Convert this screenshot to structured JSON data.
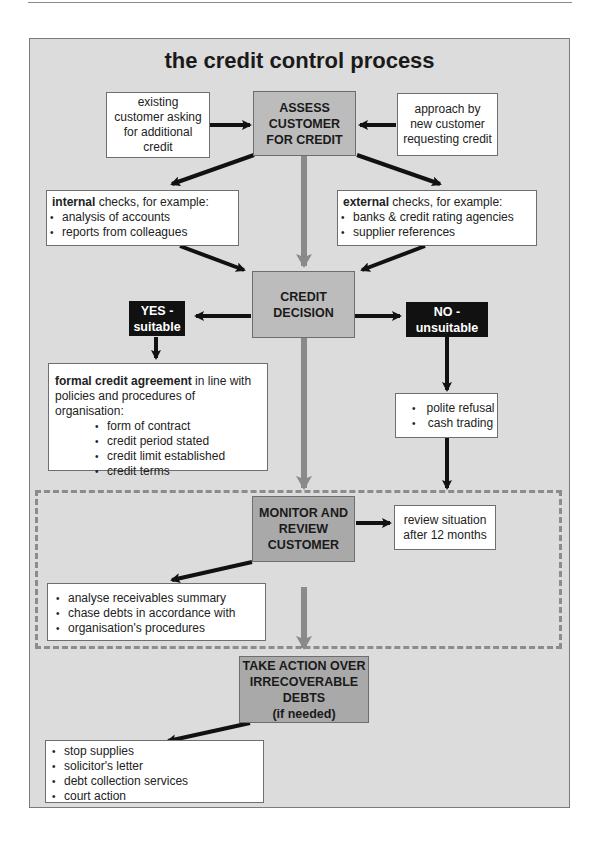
{
  "diagram": {
    "title": "the credit control process",
    "nodes": {
      "assess": {
        "lines": [
          "ASSESS",
          "CUSTOMER",
          "FOR CREDIT"
        ]
      },
      "existing_customer": {
        "lines": [
          "existing",
          "customer asking",
          "for additional",
          "credit"
        ]
      },
      "new_customer": {
        "lines": [
          "approach by",
          "new customer",
          "requesting credit"
        ]
      },
      "internal_checks": {
        "heading_bold": "internal",
        "heading_rest": " checks, for example:",
        "items": [
          "analysis of accounts",
          "reports from colleagues"
        ]
      },
      "external_checks": {
        "heading_bold": "external",
        "heading_rest": " checks, for example:",
        "items": [
          "banks & credit rating agencies",
          "supplier references"
        ]
      },
      "credit_decision": {
        "lines": [
          "CREDIT",
          "DECISION"
        ]
      },
      "yes": {
        "lines": [
          "YES -",
          "suitable"
        ]
      },
      "no": {
        "lines": [
          "NO -",
          "unsuitable"
        ]
      },
      "formal_agreement": {
        "heading_bold": "formal credit agreement",
        "heading_rest": " in line with",
        "line2": "policies and procedures of organisation:",
        "items": [
          "form of contract",
          "credit period stated",
          "credit limit established",
          "credit terms"
        ]
      },
      "unsuitable_actions": {
        "items": [
          "polite refusal",
          "cash trading"
        ]
      },
      "monitor": {
        "lines": [
          "MONITOR AND",
          "REVIEW",
          "CUSTOMER"
        ]
      },
      "review_situation": {
        "lines": [
          "review situation",
          "after 12 months"
        ]
      },
      "monitor_actions": {
        "items": [
          "analyse receivables summary",
          "chase debts in accordance with",
          "organisation's procedures"
        ]
      },
      "take_action": {
        "lines": [
          "TAKE ACTION OVER",
          "IRRECOVERABLE",
          "DEBTS",
          "(if needed)"
        ]
      },
      "debt_actions": {
        "items": [
          "stop supplies",
          "solicitor's letter",
          "debt collection services",
          "court action"
        ]
      }
    },
    "colors": {
      "panel_bg": "#dcdcdc",
      "primary_box": "#bcbcbc",
      "secondary_box": "#a9a9a9",
      "decision_label_bg": "#111111",
      "main_flow_arrow": "#8a8a8a",
      "branch_arrow": "#111111",
      "dashed_border": "#8c8c8c"
    }
  }
}
